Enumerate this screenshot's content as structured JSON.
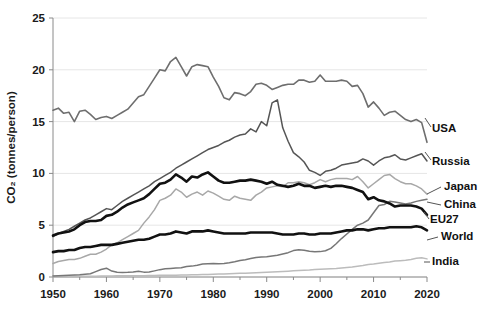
{
  "chart_data": {
    "type": "line",
    "title": "",
    "xlabel": "",
    "ylabel": "CO₂ (tonnes/person)",
    "xlim": [
      1950,
      2020
    ],
    "ylim": [
      0,
      25
    ],
    "grid": "horizontal",
    "legend_position": "right-inline-labels",
    "xticks": [
      "1950",
      "1960",
      "1970",
      "1980",
      "1990",
      "2000",
      "2010",
      "2020"
    ],
    "xtick_values": [
      1950,
      1960,
      1970,
      1980,
      1990,
      2000,
      2010,
      2020
    ],
    "yticks": [
      "0",
      "5",
      "10",
      "15",
      "20",
      "25"
    ],
    "ytick_values": [
      0,
      5,
      10,
      15,
      20,
      25
    ],
    "x": [
      1950,
      1951,
      1952,
      1953,
      1954,
      1955,
      1956,
      1957,
      1958,
      1959,
      1960,
      1961,
      1962,
      1963,
      1964,
      1965,
      1966,
      1967,
      1968,
      1969,
      1970,
      1971,
      1972,
      1973,
      1974,
      1975,
      1976,
      1977,
      1978,
      1979,
      1980,
      1981,
      1982,
      1983,
      1984,
      1985,
      1986,
      1987,
      1988,
      1989,
      1990,
      1991,
      1992,
      1993,
      1994,
      1995,
      1996,
      1997,
      1998,
      1999,
      2000,
      2001,
      2002,
      2003,
      2004,
      2005,
      2006,
      2007,
      2008,
      2009,
      2010,
      2011,
      2012,
      2013,
      2014,
      2015,
      2016,
      2017,
      2018,
      2019,
      2020
    ],
    "series": [
      {
        "name": "USA",
        "color": "#6e6e6e",
        "width": 1.6,
        "label": "USA",
        "values": [
          16.1,
          16.3,
          15.8,
          15.9,
          15.0,
          16.0,
          16.1,
          15.7,
          15.2,
          15.4,
          15.5,
          15.3,
          15.6,
          15.9,
          16.2,
          16.8,
          17.4,
          17.6,
          18.4,
          19.2,
          20.0,
          19.9,
          20.8,
          21.2,
          20.3,
          19.4,
          20.3,
          20.5,
          20.4,
          20.3,
          19.3,
          18.4,
          17.3,
          17.1,
          17.8,
          17.7,
          17.5,
          17.9,
          18.6,
          18.7,
          18.5,
          18.1,
          18.3,
          18.5,
          18.6,
          18.6,
          19.0,
          19.0,
          18.8,
          18.9,
          19.5,
          18.9,
          18.9,
          18.9,
          19.0,
          18.9,
          18.4,
          18.5,
          17.7,
          16.4,
          16.9,
          16.3,
          15.6,
          15.9,
          16.0,
          15.6,
          15.2,
          15.0,
          15.2,
          14.9,
          13.0
        ]
      },
      {
        "name": "Russia",
        "color": "#555555",
        "width": 1.5,
        "label": "Russia",
        "values": [
          3.9,
          4.2,
          4.4,
          4.6,
          4.9,
          5.2,
          5.5,
          5.7,
          6.0,
          6.3,
          6.6,
          6.5,
          6.9,
          7.3,
          7.6,
          7.9,
          8.2,
          8.5,
          8.8,
          9.2,
          9.5,
          9.8,
          10.1,
          10.5,
          10.8,
          11.1,
          11.4,
          11.7,
          12.0,
          12.3,
          12.5,
          12.7,
          13.0,
          13.2,
          13.5,
          13.7,
          13.8,
          14.3,
          14.0,
          15.0,
          14.6,
          16.8,
          17.1,
          14.4,
          13.1,
          12.0,
          11.6,
          11.1,
          10.3,
          10.1,
          9.8,
          10.2,
          10.3,
          10.5,
          10.8,
          10.9,
          11.0,
          11.1,
          11.4,
          11.2,
          10.8,
          11.2,
          11.5,
          11.6,
          11.8,
          11.4,
          11.3,
          11.5,
          11.7,
          11.9,
          11.2
        ]
      },
      {
        "name": "Japan",
        "color": "#a8a8a8",
        "width": 1.5,
        "label": "Japan",
        "values": [
          1.3,
          1.5,
          1.6,
          1.7,
          1.7,
          1.8,
          2.0,
          2.2,
          2.2,
          2.4,
          2.7,
          3.1,
          3.3,
          3.6,
          3.9,
          4.2,
          4.5,
          5.2,
          5.8,
          6.5,
          7.4,
          7.6,
          7.9,
          8.5,
          8.2,
          7.7,
          8.0,
          8.2,
          7.9,
          8.3,
          8.1,
          7.8,
          7.5,
          7.4,
          7.8,
          7.6,
          7.5,
          7.4,
          7.9,
          8.2,
          8.6,
          8.7,
          8.8,
          8.7,
          9.1,
          9.1,
          9.2,
          9.1,
          8.9,
          9.1,
          9.4,
          9.2,
          9.4,
          9.5,
          9.5,
          9.5,
          9.4,
          9.7,
          9.2,
          8.6,
          9.0,
          9.4,
          9.8,
          9.9,
          9.5,
          9.2,
          9.0,
          9.0,
          8.8,
          8.5,
          8.0
        ]
      },
      {
        "name": "China",
        "color": "#777777",
        "width": 1.5,
        "label": "China",
        "values": [
          0.1,
          0.12,
          0.14,
          0.17,
          0.19,
          0.21,
          0.27,
          0.31,
          0.52,
          0.73,
          0.85,
          0.57,
          0.45,
          0.44,
          0.45,
          0.49,
          0.55,
          0.47,
          0.48,
          0.59,
          0.71,
          0.79,
          0.83,
          0.87,
          0.89,
          1.02,
          1.05,
          1.14,
          1.25,
          1.29,
          1.3,
          1.27,
          1.31,
          1.38,
          1.48,
          1.6,
          1.67,
          1.78,
          1.88,
          1.93,
          1.95,
          2.02,
          2.1,
          2.23,
          2.35,
          2.55,
          2.62,
          2.58,
          2.48,
          2.43,
          2.45,
          2.53,
          2.76,
          3.21,
          3.71,
          4.15,
          4.6,
          5.0,
          5.2,
          5.5,
          6.2,
          6.9,
          7.0,
          7.3,
          7.25,
          7.15,
          7.05,
          7.15,
          7.3,
          7.4,
          7.5
        ]
      },
      {
        "name": "EU27",
        "color": "#111111",
        "width": 2.6,
        "label": "EU27",
        "values": [
          4.0,
          4.2,
          4.3,
          4.4,
          4.6,
          5.0,
          5.3,
          5.4,
          5.4,
          5.5,
          5.9,
          6.0,
          6.3,
          6.7,
          7.0,
          7.2,
          7.4,
          7.6,
          8.0,
          8.5,
          9.0,
          9.1,
          9.4,
          9.9,
          9.6,
          9.2,
          9.7,
          9.6,
          9.9,
          10.1,
          9.7,
          9.3,
          9.1,
          9.1,
          9.2,
          9.3,
          9.3,
          9.4,
          9.3,
          9.2,
          9.0,
          9.2,
          8.9,
          8.8,
          8.7,
          8.8,
          9.0,
          8.8,
          8.8,
          8.6,
          8.7,
          8.8,
          8.7,
          8.8,
          8.8,
          8.7,
          8.6,
          8.4,
          8.2,
          7.5,
          7.7,
          7.4,
          7.3,
          7.1,
          6.8,
          6.9,
          6.9,
          6.9,
          6.8,
          6.6,
          6.0
        ]
      },
      {
        "name": "World",
        "color": "#111111",
        "width": 2.6,
        "label": "World",
        "values": [
          2.4,
          2.5,
          2.5,
          2.6,
          2.6,
          2.8,
          2.9,
          2.9,
          3.0,
          3.1,
          3.1,
          3.1,
          3.2,
          3.3,
          3.4,
          3.5,
          3.6,
          3.6,
          3.7,
          3.9,
          4.1,
          4.1,
          4.2,
          4.4,
          4.3,
          4.2,
          4.4,
          4.4,
          4.4,
          4.5,
          4.4,
          4.3,
          4.2,
          4.2,
          4.2,
          4.2,
          4.2,
          4.3,
          4.3,
          4.3,
          4.3,
          4.3,
          4.2,
          4.1,
          4.1,
          4.1,
          4.2,
          4.2,
          4.1,
          4.1,
          4.2,
          4.2,
          4.2,
          4.3,
          4.4,
          4.5,
          4.5,
          4.6,
          4.6,
          4.5,
          4.6,
          4.7,
          4.7,
          4.8,
          4.8,
          4.8,
          4.8,
          4.8,
          4.9,
          4.8,
          4.5
        ]
      },
      {
        "name": "India",
        "color": "#bcbcbc",
        "width": 1.5,
        "label": "India",
        "values": [
          0.05,
          0.06,
          0.06,
          0.06,
          0.07,
          0.07,
          0.08,
          0.08,
          0.08,
          0.09,
          0.1,
          0.1,
          0.11,
          0.11,
          0.12,
          0.12,
          0.13,
          0.13,
          0.14,
          0.15,
          0.16,
          0.17,
          0.18,
          0.18,
          0.19,
          0.2,
          0.21,
          0.22,
          0.23,
          0.25,
          0.26,
          0.28,
          0.29,
          0.31,
          0.33,
          0.35,
          0.37,
          0.39,
          0.41,
          0.44,
          0.46,
          0.48,
          0.51,
          0.53,
          0.56,
          0.6,
          0.63,
          0.66,
          0.68,
          0.72,
          0.75,
          0.78,
          0.8,
          0.82,
          0.87,
          0.91,
          0.96,
          1.03,
          1.1,
          1.2,
          1.25,
          1.32,
          1.4,
          1.45,
          1.55,
          1.58,
          1.62,
          1.7,
          1.8,
          1.85,
          1.75
        ]
      }
    ]
  }
}
